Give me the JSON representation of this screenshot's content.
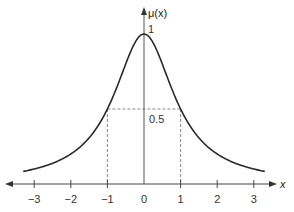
{
  "chart_data": {
    "type": "line",
    "title": "",
    "function": "mu(x) = 1 / (1 + x^2)",
    "xlabel": "x",
    "ylabel": "μ(x)",
    "xlim": [
      -3.3,
      3.3
    ],
    "ylim": [
      0,
      1
    ],
    "x_ticks": [
      -3,
      -2,
      -1,
      0,
      1,
      2,
      3
    ],
    "x_tick_labels": [
      "−3",
      "−2",
      "−1",
      "0",
      "1",
      "2",
      "3"
    ],
    "annotations": [
      {
        "text": "1",
        "at": [
          0,
          1
        ],
        "note": "peak value"
      },
      {
        "text": "0.5",
        "at": [
          0,
          0.5
        ],
        "note": "dashed guide lines at x=±1, y=0.5"
      }
    ],
    "series": [
      {
        "name": "μ(x)",
        "x": [
          -3.25,
          -3,
          -2.5,
          -2,
          -1.5,
          -1,
          -0.5,
          0,
          0.5,
          1,
          1.5,
          2,
          2.5,
          3,
          3.25
        ],
        "values": [
          0.086,
          0.1,
          0.138,
          0.2,
          0.308,
          0.5,
          0.8,
          1.0,
          0.8,
          0.5,
          0.308,
          0.2,
          0.138,
          0.1,
          0.086
        ]
      }
    ],
    "grid": false,
    "legend": null
  },
  "labels": {
    "y_axis": "μ(x)",
    "x_axis": "x",
    "peak": "1",
    "half": "0.5",
    "ticks": [
      "−3",
      "−2",
      "−1",
      "0",
      "1",
      "2",
      "3"
    ]
  },
  "colors": {
    "curve": "#2a2a2a",
    "axis": "#444444",
    "dashed": "#888888",
    "text": "#333333"
  }
}
